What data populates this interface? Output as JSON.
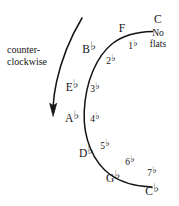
{
  "figure": {
    "type": "circle-of-fifths-flats-arc",
    "background_color": "#ffffff",
    "ink_color": "#141414"
  },
  "direction_note": {
    "line1": "counter-",
    "line2": "clockwise",
    "arrow_icon": "curved-down-arrow-icon"
  },
  "tonic_arc": {
    "description": "arc of keys on the flat side of the circle of fifths",
    "keys": [
      {
        "letter": "C",
        "accidental": "",
        "x": 158,
        "y": 18
      },
      {
        "letter": "F",
        "accidental": "",
        "x": 122,
        "y": 27
      },
      {
        "letter": "B",
        "accidental": "♭",
        "x": 89,
        "y": 48
      },
      {
        "letter": "E",
        "accidental": "♭",
        "x": 72,
        "y": 86
      },
      {
        "letter": "A",
        "accidental": "♭",
        "x": 72,
        "y": 117
      },
      {
        "letter": "D",
        "accidental": "♭",
        "x": 86,
        "y": 152
      },
      {
        "letter": "G",
        "accidental": "♭",
        "x": 113,
        "y": 177
      },
      {
        "letter": "C",
        "accidental": "♭",
        "x": 152,
        "y": 190
      }
    ]
  },
  "flat_counts": {
    "none": {
      "line1": "No",
      "line2": "flats",
      "x": 158,
      "y": 39
    },
    "items": [
      {
        "number": "1",
        "accidental": "♭",
        "x": 133,
        "y": 45
      },
      {
        "number": "2",
        "accidental": "♭",
        "x": 111,
        "y": 60
      },
      {
        "number": "3",
        "accidental": "♭",
        "x": 95,
        "y": 88
      },
      {
        "number": "4",
        "accidental": "♭",
        "x": 95,
        "y": 118
      },
      {
        "number": "5",
        "accidental": "♭",
        "x": 105,
        "y": 145
      },
      {
        "number": "6",
        "accidental": "♭",
        "x": 130,
        "y": 161
      },
      {
        "number": "7",
        "accidental": "♭",
        "x": 152,
        "y": 172
      }
    ]
  }
}
